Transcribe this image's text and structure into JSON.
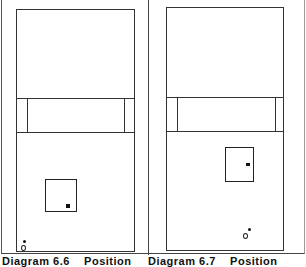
{
  "figure": {
    "panels": [
      {
        "id": "diagram-6-6",
        "caption_number": "Diagram 6.6",
        "caption_text": "Position",
        "court": {
          "x": 16,
          "y": 9,
          "w": 119,
          "h": 243
        },
        "band": {
          "y": 98,
          "h": 35,
          "inner_left": 27,
          "inner_right": 124
        },
        "box": {
          "x": 45,
          "y": 179,
          "w": 32,
          "h": 33
        },
        "box_marker": {
          "x": 66,
          "y": 204,
          "w": 4,
          "h": 4
        },
        "dot": {
          "x": 23,
          "y": 240
        },
        "ring": {
          "x": 21,
          "y": 246
        }
      },
      {
        "id": "diagram-6-7",
        "caption_number": "Diagram 6.7",
        "caption_text": "Position",
        "court": {
          "x": 166,
          "y": 7,
          "w": 118,
          "h": 244
        },
        "band": {
          "y": 97,
          "h": 35,
          "inner_left": 177,
          "inner_right": 275
        },
        "box": {
          "x": 225,
          "y": 147,
          "w": 29,
          "h": 35
        },
        "box_marker": {
          "x": 246,
          "y": 163,
          "w": 4,
          "h": 3
        },
        "dot": {
          "x": 248,
          "y": 228
        },
        "ring": {
          "x": 243,
          "y": 234
        }
      }
    ],
    "colors": {
      "line": "#333333",
      "background": "#ffffff",
      "text": "#111111"
    }
  }
}
